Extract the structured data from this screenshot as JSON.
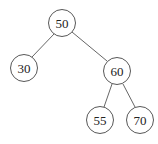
{
  "diagram": {
    "type": "binary-search-tree",
    "nodes": [
      {
        "id": "n50",
        "label": "50",
        "x": 62,
        "y": 23
      },
      {
        "id": "n30",
        "label": "30",
        "x": 24,
        "y": 68
      },
      {
        "id": "n60",
        "label": "60",
        "x": 117,
        "y": 71
      },
      {
        "id": "n55",
        "label": "55",
        "x": 100,
        "y": 120
      },
      {
        "id": "n70",
        "label": "70",
        "x": 140,
        "y": 120
      }
    ],
    "edges": [
      {
        "from": "n50",
        "to": "n30"
      },
      {
        "from": "n50",
        "to": "n60"
      },
      {
        "from": "n60",
        "to": "n55"
      },
      {
        "from": "n60",
        "to": "n70"
      }
    ]
  }
}
